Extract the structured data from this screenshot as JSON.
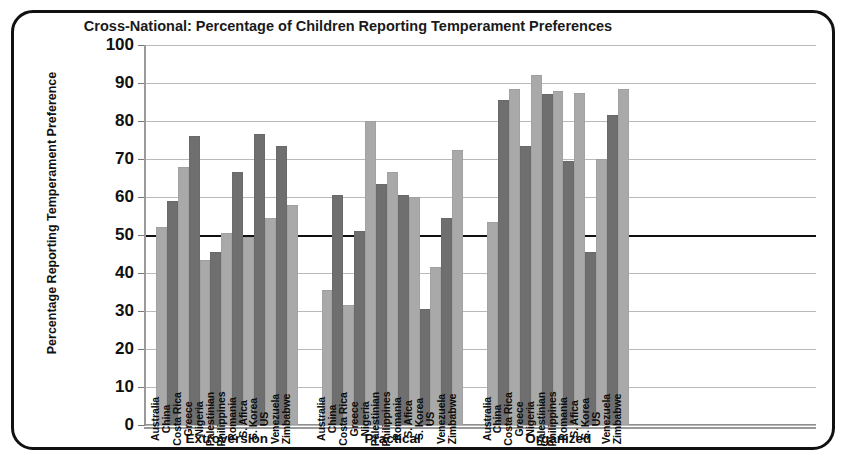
{
  "chart_data": {
    "type": "bar",
    "title": "Cross-National: Percentage of Children Reporting Temperament Preferences",
    "xlabel": "",
    "ylabel": "Percentage Reporting Temperament Preference",
    "ylim": [
      0,
      100
    ],
    "ytick_step": 10,
    "yticks": [
      100,
      90,
      80,
      70,
      60,
      50,
      40,
      30,
      20,
      10,
      0
    ],
    "grid": true,
    "emphasized_gridline": 50,
    "legend": "none",
    "groups": [
      "Extroversion",
      "Practical",
      "Organized"
    ],
    "categories": [
      "Australia",
      "China",
      "Costa Rica",
      "Greece",
      "Nigeria",
      "Palestinian",
      "Philippines",
      "Romania",
      "S. Afica",
      "S. Korea",
      "US",
      "Venezuela",
      "Zimbabwe"
    ],
    "series": [
      {
        "name": "Extroversion",
        "values": [
          52,
          59,
          68,
          76,
          43.5,
          45.5,
          50.5,
          66.5,
          49.5,
          76.5,
          54.5,
          73.5,
          58
        ]
      },
      {
        "name": "Practical",
        "values": [
          35.5,
          60.5,
          31.5,
          51,
          80,
          63.5,
          66.5,
          60.5,
          60,
          30.5,
          41.5,
          54.5,
          72.5
        ]
      },
      {
        "name": "Organized",
        "values": [
          53.5,
          85.5,
          88.5,
          73.5,
          92,
          87,
          88,
          69.5,
          87.5,
          45.5,
          70,
          81.5,
          88.5
        ]
      }
    ],
    "bar_colors": {
      "light": "#a9a9a9",
      "dark": "#6f6f6f",
      "alternating": true
    }
  }
}
